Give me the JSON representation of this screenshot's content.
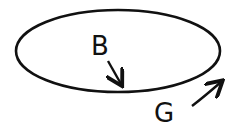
{
  "diagram": {
    "shape": "ellipse",
    "labels": [
      {
        "id": "B",
        "text": "B",
        "position": "inside ellipse",
        "arrow": "pointing down toward ellipse boundary"
      },
      {
        "id": "G",
        "text": "G",
        "position": "outside ellipse, bottom-right",
        "arrow": "pointing up-right along ellipse boundary"
      }
    ],
    "colors": {
      "stroke": "#111111",
      "background": "#ffffff"
    }
  }
}
